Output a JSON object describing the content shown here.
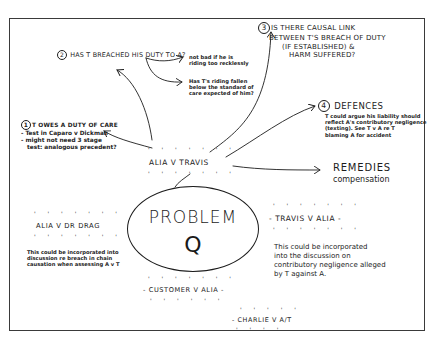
{
  "diagram": {
    "type": "hand-drawn mind map",
    "center": {
      "title": "PROBLEM",
      "subtitle": "Q"
    },
    "parties": {
      "main": "ALIA v TRAVIS",
      "alia_drdrag": "ALIA v DR DRAG",
      "travis_alia": "TRAVIS v ALIA",
      "customer_alia": "CUSTOMER v ALIA",
      "charlie_at": "CHARLIE v A/T"
    },
    "branches": {
      "duty_of_care": {
        "number": "1",
        "heading": "T OWES A DUTY OF CARE",
        "lines": [
          "- Test in Caparo v Dickman",
          "- might not need 3 stage",
          "test: analogous precedent?"
        ]
      },
      "breach": {
        "number": "2",
        "heading": "HAS T BREACHED HIS DUTY TO A?",
        "sub1": [
          "not bad if he is",
          "riding too recklessly"
        ],
        "sub2": [
          "Has T's riding fallen",
          "below the standard of",
          "care expected of him?"
        ]
      },
      "causation": {
        "number": "3",
        "lines": [
          "IS THERE CAUSAL LINK",
          "BETWEEN T'S BREACH OF DUTY",
          "(IF ESTABLISHED) &",
          "HARM SUFFERED?"
        ]
      },
      "defences": {
        "number": "4",
        "heading": "DEFENCES",
        "lines": [
          "T could argue his liability should",
          "reflect A's contributory negligence",
          "(texting). See T v A re T",
          "blaming A for accident"
        ]
      },
      "remedies": {
        "heading": "REMEDIES",
        "detail": "compensation"
      }
    },
    "notes": {
      "alia_drdrag": [
        "This could be incorporated into",
        "discussion re breach in chain",
        "causation when assessing A v T"
      ],
      "travis_alia": [
        "This could be incorporated",
        "into the discussion on",
        "contributory negligence alleged",
        "by T against A."
      ]
    },
    "colors": {
      "ink": "#1c1c1c",
      "paper": "#ffffff",
      "frame": "#3a3a3a"
    }
  }
}
